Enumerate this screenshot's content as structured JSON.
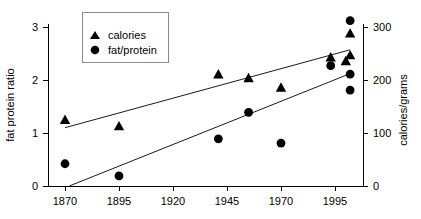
{
  "chart_data": {
    "type": "scatter",
    "title": "",
    "xlabel": "",
    "ylabel": "fat protein ratio",
    "y2label": "calories/grams",
    "xlim": [
      1862,
      2008
    ],
    "ylim": [
      0,
      3.25
    ],
    "y2lim": [
      0,
      325
    ],
    "grid": false,
    "legend_position": "top-left",
    "xticks": [
      "1870",
      "1895",
      "1920",
      "1945",
      "1970",
      "1995"
    ],
    "xtick_values": [
      1870,
      1895,
      1920,
      1945,
      1970,
      1995
    ],
    "yticks": [
      "0",
      "1",
      "2",
      "3"
    ],
    "ytick_values": [
      0,
      1,
      2,
      3
    ],
    "y2ticks": [
      "0",
      "100",
      "200",
      "300"
    ],
    "y2tick_values": [
      0,
      100,
      200,
      300
    ],
    "series": [
      {
        "name": "calories",
        "marker": "triangle",
        "axis": "right",
        "units": "calories/grams",
        "points": [
          {
            "x": 1870,
            "y": 125
          },
          {
            "x": 1895,
            "y": 113
          },
          {
            "x": 1941,
            "y": 211
          },
          {
            "x": 1955,
            "y": 204
          },
          {
            "x": 1970,
            "y": 186
          },
          {
            "x": 1993,
            "y": 243
          },
          {
            "x": 2000,
            "y": 236
          },
          {
            "x": 2002,
            "y": 247
          },
          {
            "x": 2002,
            "y": 288
          }
        ]
      },
      {
        "name": "fat/protein",
        "marker": "circle",
        "axis": "left",
        "units": "fat protein ratio",
        "points": [
          {
            "x": 1870,
            "y": 0.42
          },
          {
            "x": 1895,
            "y": 0.19
          },
          {
            "x": 1941,
            "y": 0.89
          },
          {
            "x": 1955,
            "y": 1.39
          },
          {
            "x": 1970,
            "y": 0.81
          },
          {
            "x": 1993,
            "y": 2.27
          },
          {
            "x": 2002,
            "y": 2.11
          },
          {
            "x": 2002,
            "y": 1.81
          },
          {
            "x": 2002,
            "y": 3.12
          }
        ]
      }
    ],
    "trend_lines": [
      {
        "name": "calories-trend",
        "axis": "right",
        "x0": 1870,
        "y0": 110,
        "x1": 2002,
        "y1": 257
      },
      {
        "name": "fat-protein-trend",
        "axis": "left",
        "x0": 1872,
        "y0": 0.0,
        "x1": 2002,
        "y1": 2.12
      }
    ]
  },
  "legend": {
    "items": [
      {
        "label": "calories",
        "marker": "triangle"
      },
      {
        "label": "fat/protein",
        "marker": "circle"
      }
    ]
  }
}
